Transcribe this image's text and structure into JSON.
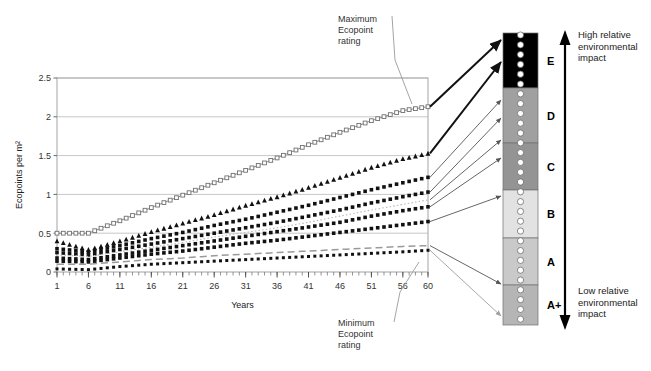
{
  "chart_data": {
    "type": "line",
    "title": "",
    "xlabel": "Years",
    "ylabel": "Ecopoints per m²",
    "xlim": [
      1,
      60
    ],
    "ylim": [
      0,
      2.5
    ],
    "xticks": [
      "1",
      "6",
      "11",
      "16",
      "21",
      "26",
      "31",
      "36",
      "41",
      "46",
      "51",
      "56",
      "60"
    ],
    "yticks": [
      "0",
      "0.5",
      "1",
      "1.5",
      "2",
      "2.5"
    ],
    "grid": true,
    "legend": "none",
    "x": [
      1,
      6,
      11,
      16,
      21,
      26,
      31,
      36,
      41,
      46,
      51,
      56,
      60
    ],
    "series": [
      {
        "name": "Series 1 (maximum)",
        "style": "open-square-gray",
        "color": "#8c8c8c",
        "values": [
          0.5,
          0.5,
          0.66,
          0.83,
          0.99,
          1.15,
          1.31,
          1.47,
          1.64,
          1.8,
          1.95,
          2.08,
          2.13
        ]
      },
      {
        "name": "Series 2",
        "style": "filled-triangle-black",
        "color": "#111111",
        "values": [
          0.4,
          0.29,
          0.4,
          0.52,
          0.63,
          0.74,
          0.86,
          0.97,
          1.09,
          1.22,
          1.35,
          1.46,
          1.53
        ]
      },
      {
        "name": "Series 3",
        "style": "filled-square-black",
        "color": "#111111",
        "values": [
          0.3,
          0.26,
          0.34,
          0.43,
          0.51,
          0.6,
          0.68,
          0.77,
          0.86,
          0.96,
          1.06,
          1.15,
          1.22
        ]
      },
      {
        "name": "Series 4",
        "style": "filled-square-black",
        "color": "#111111",
        "values": [
          0.25,
          0.22,
          0.29,
          0.36,
          0.43,
          0.5,
          0.57,
          0.64,
          0.72,
          0.8,
          0.89,
          0.97,
          1.03
        ]
      },
      {
        "name": "Series 5",
        "style": "dotted-gray-light",
        "color": "#b8b8b8",
        "values": [
          0.22,
          0.2,
          0.26,
          0.32,
          0.38,
          0.45,
          0.51,
          0.57,
          0.64,
          0.72,
          0.8,
          0.87,
          0.93
        ]
      },
      {
        "name": "Series 6",
        "style": "filled-square-black",
        "color": "#111111",
        "values": [
          0.18,
          0.16,
          0.22,
          0.28,
          0.34,
          0.4,
          0.46,
          0.52,
          0.58,
          0.64,
          0.72,
          0.79,
          0.84
        ]
      },
      {
        "name": "Series 7",
        "style": "filled-square-black",
        "color": "#111111",
        "values": [
          0.14,
          0.13,
          0.18,
          0.23,
          0.27,
          0.32,
          0.37,
          0.41,
          0.46,
          0.51,
          0.56,
          0.61,
          0.65
        ]
      },
      {
        "name": "Series 8 (dashed)",
        "style": "dashed-gray",
        "color": "#9a9a9a",
        "values": [
          0.1,
          0.1,
          0.13,
          0.16,
          0.18,
          0.21,
          0.23,
          0.25,
          0.27,
          0.29,
          0.31,
          0.33,
          0.34
        ]
      },
      {
        "name": "Series 9 (minimum)",
        "style": "filled-square-black-small",
        "color": "#111111",
        "values": [
          0.04,
          0.03,
          0.07,
          0.1,
          0.12,
          0.14,
          0.16,
          0.18,
          0.2,
          0.22,
          0.24,
          0.26,
          0.28
        ]
      }
    ]
  },
  "annotations": {
    "maximum": "Maximum\nEcopoint\nrating",
    "maximum_lines": [
      "Maximum",
      "Ecopoint",
      "rating"
    ],
    "minimum_lines": [
      "Minimum",
      "Ecopoint",
      "rating"
    ]
  },
  "rating_scale": {
    "bands": [
      {
        "label": "E",
        "color": "#000000",
        "top": 33,
        "bottom": 88
      },
      {
        "label": "D",
        "color": "#a0a0a0",
        "top": 88,
        "bottom": 143
      },
      {
        "label": "C",
        "color": "#949494",
        "top": 143,
        "bottom": 190
      },
      {
        "label": "B",
        "color": "#e2e2e2",
        "top": 190,
        "bottom": 238
      },
      {
        "label": "A",
        "color": "#c9c9c9",
        "top": 238,
        "bottom": 285
      },
      {
        "label": "A+",
        "color": "#b5b5b5",
        "top": 285,
        "bottom": 325
      }
    ],
    "top_label_lines": [
      "High relative",
      "environmental",
      "impact"
    ],
    "bottom_label_lines": [
      "Low relative",
      "environmental",
      "impact"
    ]
  }
}
